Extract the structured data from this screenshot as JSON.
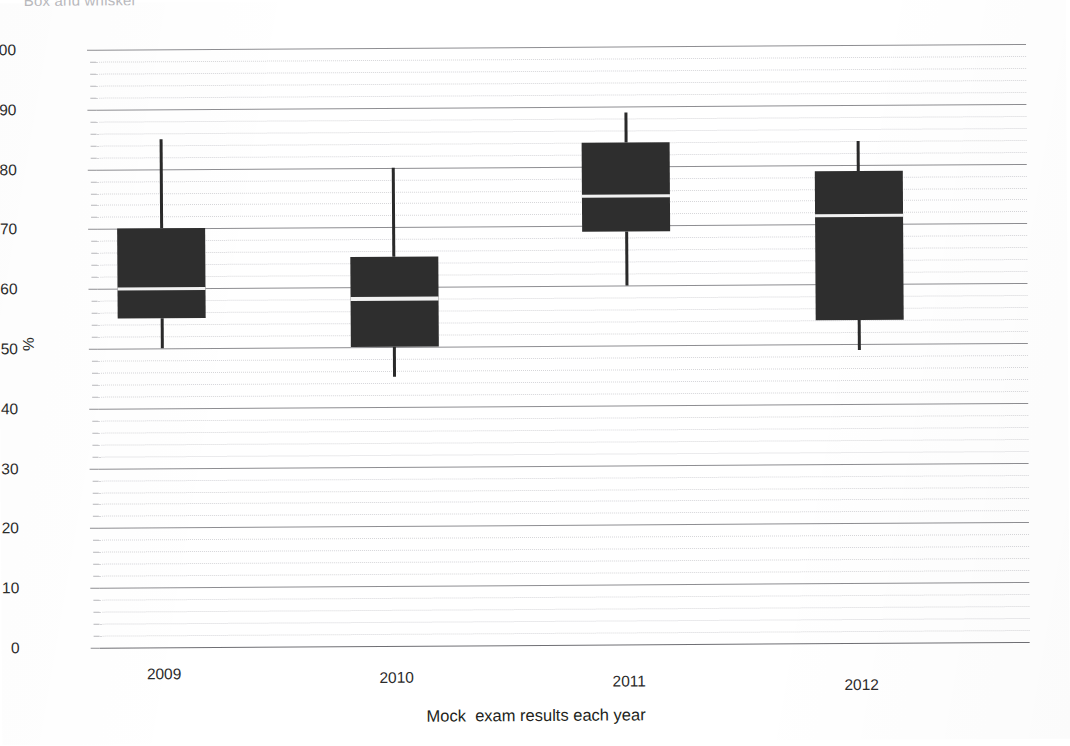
{
  "page": {
    "clipped_title": "Box and whisker",
    "y_axis_caption": "%",
    "x_axis_title": "Mock  exam results each year"
  },
  "chart_data": {
    "type": "box",
    "title": "Box and whisker",
    "xlabel": "Mock  exam results each year",
    "ylabel": "%",
    "ylim": [
      0,
      100
    ],
    "ytick_labels": [
      "0",
      "10",
      "20",
      "30",
      "40",
      "50",
      "60",
      "70",
      "80",
      "90",
      "100"
    ],
    "ytick_values": [
      0,
      10,
      20,
      30,
      40,
      50,
      60,
      70,
      80,
      90,
      100
    ],
    "major_gridline_step": 10,
    "minor_gridline_step": 2,
    "grid": "major solid, minor dotted",
    "legend": "none",
    "categories": [
      "2009",
      "2010",
      "2011",
      "2012"
    ],
    "boxes": [
      {
        "category": "2009",
        "whisker_low": 50,
        "q1": 55,
        "median": 60,
        "q3": 70,
        "whisker_high": 85
      },
      {
        "category": "2010",
        "whisker_low": 45,
        "q1": 50,
        "median": 58,
        "q3": 65,
        "whisker_high": 80
      },
      {
        "category": "2011",
        "whisker_low": 60,
        "q1": 69,
        "median": 75,
        "q3": 84,
        "whisker_high": 89
      },
      {
        "category": "2012",
        "whisker_low": 49,
        "q1": 54,
        "median": 71.5,
        "q3": 79,
        "whisker_high": 84
      }
    ],
    "colors": {
      "box_fill": "#2e2e2e",
      "median_line": "#f2f2f2",
      "whisker": "#2a2a2a",
      "major_grid": "#8e8e92",
      "minor_grid": "#cfcfd3",
      "text": "#2b2b2b",
      "background": "#ffffff"
    }
  }
}
